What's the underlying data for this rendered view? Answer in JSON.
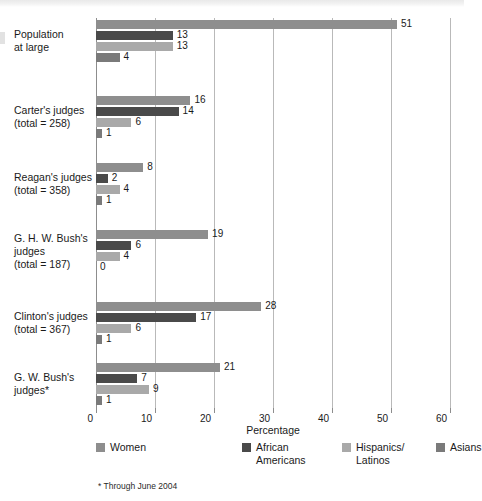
{
  "chart_data": {
    "type": "bar",
    "orientation": "horizontal",
    "title": "",
    "xlabel": "Percentage",
    "ylabel": "",
    "xlim": [
      0,
      60
    ],
    "xticks": [
      0,
      10,
      20,
      30,
      40,
      50,
      60
    ],
    "xtick_labels": [
      "0",
      "10",
      "20",
      "30",
      "40",
      "50",
      "60"
    ],
    "grid": "vertical",
    "legend_position": "bottom",
    "footnote": "* Through June 2004",
    "categories": [
      "Population\nat large",
      "Carter's judges\n(total = 258)",
      "Reagan's judges\n(total = 358)",
      "G. H. W. Bush's\njudges\n(total = 187)",
      "Clinton's judges\n(total = 367)",
      "G. W. Bush's\njudges*"
    ],
    "series": [
      {
        "name": "Women",
        "color": "#8e8e8e",
        "values": [
          51,
          16,
          8,
          19,
          28,
          21
        ],
        "labels": [
          "51",
          "16",
          "8",
          "19",
          "28",
          "21"
        ]
      },
      {
        "name": "African\nAmericans",
        "color": "#4a4a4a",
        "values": [
          13,
          14,
          2,
          6,
          17,
          7
        ],
        "labels": [
          "13",
          "14",
          "2",
          "6",
          "17",
          "7"
        ]
      },
      {
        "name": "Hispanics/\nLatinos",
        "color": "#a9a9a9",
        "values": [
          13,
          6,
          4,
          4,
          6,
          9
        ],
        "labels": [
          "13",
          "6",
          "4",
          "4",
          "6",
          "9"
        ]
      },
      {
        "name": "Asians",
        "color": "#7a7a7a",
        "values": [
          4,
          1,
          1,
          0,
          1,
          1
        ],
        "labels": [
          "4",
          "1",
          "1",
          "0",
          "1",
          "1"
        ]
      }
    ]
  },
  "colors": {
    "women": "#8e8e8e",
    "african_americans": "#4a4a4a",
    "hispanics_latinos": "#a9a9a9",
    "asians": "#7a7a7a",
    "gridline": "#b9b9b9",
    "axis": "#8d8d8d",
    "text": "#1a1a1a"
  }
}
